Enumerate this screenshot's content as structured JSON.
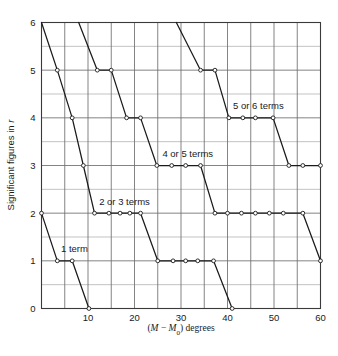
{
  "chart_data": {
    "type": "line",
    "title": "",
    "subtitle": "",
    "xlabel": "(M − M₀) degrees",
    "xlabel_parts": {
      "open": "(",
      "m": "M",
      "minus": " − ",
      "m0": "M",
      "sub": "0",
      "close": ") degrees"
    },
    "ylabel": "Significant figures in r",
    "ylabel_parts": {
      "text": "Significant figures in ",
      "ital": "r"
    },
    "xlim": [
      0,
      60
    ],
    "ylim": [
      0,
      6
    ],
    "x_major_step": 10,
    "x_minor_step": 5,
    "y_major_step": 1,
    "y_minor_step": 0.5,
    "xticks": [
      10,
      20,
      30,
      40,
      50,
      60
    ],
    "xticklabels": [
      "10",
      "20",
      "30",
      "40",
      "50",
      "60"
    ],
    "yticks": [
      0,
      1,
      2,
      3,
      4,
      5,
      6
    ],
    "yticklabels": [
      "0",
      "1",
      "2",
      "3",
      "4",
      "5",
      "6"
    ],
    "grid": true,
    "grid_color": "#6e6e6e",
    "minor_grid_color": "#a9a9a9",
    "line_color": "#1a1a1a",
    "marker": "open-circle",
    "marker_face": "#ffffff",
    "legend_position": "inline-annotations",
    "series": [
      {
        "name": "1 term",
        "points": [
          [
            0,
            2
          ],
          [
            3.4,
            1
          ],
          [
            6.6,
            1
          ],
          [
            10.2,
            0
          ]
        ]
      },
      {
        "name": "2 or 3 terms",
        "points": [
          [
            0,
            6
          ],
          [
            3.4,
            5
          ],
          [
            6.6,
            4
          ],
          [
            9.0,
            3
          ],
          [
            11.4,
            2
          ],
          [
            14.5,
            2
          ],
          [
            16.9,
            2
          ],
          [
            19.0,
            2
          ],
          [
            21.3,
            2
          ],
          [
            25.0,
            1
          ],
          [
            28.3,
            1
          ],
          [
            31.0,
            1
          ],
          [
            33.6,
            1
          ],
          [
            37.0,
            1
          ],
          [
            41.0,
            0
          ]
        ]
      },
      {
        "name": "4 or 5 terms",
        "points": [
          [
            8.0,
            6
          ],
          [
            12.0,
            5
          ],
          [
            15.0,
            5
          ],
          [
            18.3,
            4
          ],
          [
            21.3,
            4
          ],
          [
            24.8,
            3
          ],
          [
            28.0,
            3
          ],
          [
            31.0,
            3
          ],
          [
            34.2,
            3
          ],
          [
            37.3,
            2
          ],
          [
            40.0,
            2
          ],
          [
            43.0,
            2
          ],
          [
            46.0,
            2
          ],
          [
            49.0,
            2
          ],
          [
            52.0,
            2
          ],
          [
            56.2,
            2
          ],
          [
            60.0,
            1
          ]
        ]
      },
      {
        "name": "5 or 6 terms",
        "points": [
          [
            29.0,
            6
          ],
          [
            34.2,
            5
          ],
          [
            37.3,
            5
          ],
          [
            40.3,
            4
          ],
          [
            43.3,
            4
          ],
          [
            46.0,
            4
          ],
          [
            49.8,
            4
          ],
          [
            53.2,
            3
          ],
          [
            56.2,
            3
          ],
          [
            60.0,
            3
          ]
        ]
      }
    ],
    "annotations": [
      {
        "label": "1 term",
        "x": 4.2,
        "y": 1.18,
        "anchor": "start"
      },
      {
        "label": "2 or 3 terms",
        "x": 12.4,
        "y": 2.18,
        "anchor": "start"
      },
      {
        "label": "4 or 5 terms",
        "x": 26.0,
        "y": 3.18,
        "anchor": "start"
      },
      {
        "label": "5 or 6 terms",
        "x": 41.2,
        "y": 4.18,
        "anchor": "start"
      }
    ]
  }
}
